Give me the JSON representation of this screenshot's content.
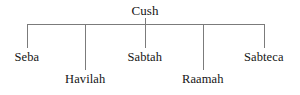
{
  "diagram": {
    "type": "genealogy-tree",
    "title": "Cush",
    "root": {
      "label": "Cush",
      "x": 145,
      "y": 4
    },
    "bar": {
      "left": 27,
      "right": 264,
      "y": 24
    },
    "stem": {
      "x": 145,
      "top": 18,
      "bottom": 24
    },
    "children": [
      {
        "label": "Seba",
        "x": 27,
        "drop_bottom": 48,
        "label_x": 9,
        "label_y": 50,
        "row": "upper"
      },
      {
        "label": "Havilah",
        "x": 85,
        "drop_bottom": 70,
        "label_x": 59,
        "label_y": 72,
        "row": "lower"
      },
      {
        "label": "Sabtah",
        "x": 145,
        "drop_bottom": 48,
        "label_x": 122,
        "label_y": 50,
        "row": "upper"
      },
      {
        "label": "Raamah",
        "x": 203,
        "drop_bottom": 70,
        "label_x": 177,
        "label_y": 72,
        "row": "lower"
      },
      {
        "label": "Sabteca",
        "x": 264,
        "drop_bottom": 48,
        "label_x": 237,
        "label_y": 50,
        "row": "upper"
      }
    ],
    "colors": {
      "line": "#7b7b7b",
      "text": "#141414",
      "background": "#ffffff"
    }
  }
}
